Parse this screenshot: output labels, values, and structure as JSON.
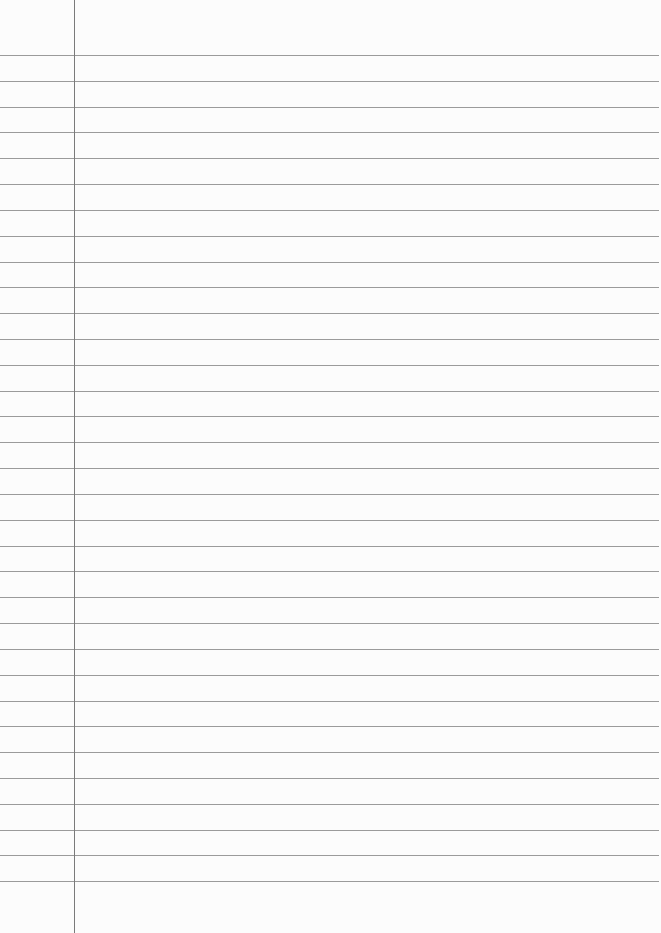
{
  "paper": {
    "type": "ruled-notebook-page",
    "background_color": "#fcfcfc",
    "rule_color": "#8a8a8a",
    "margin_line_color": "#7a7a7a",
    "margin_x": 74,
    "first_rule_y": 55,
    "rule_spacing": 25.82,
    "rule_count": 33,
    "text": ""
  }
}
